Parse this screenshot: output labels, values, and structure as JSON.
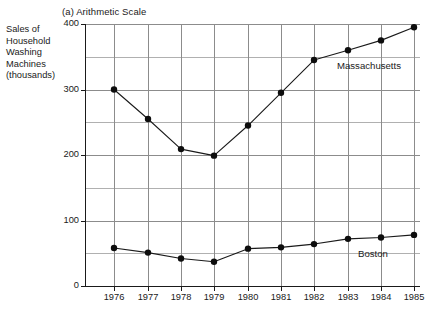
{
  "figure": {
    "title": "(a) Arithmetic Scale",
    "y_axis_block_label": [
      "Sales of",
      "Household",
      "Washing",
      "Machines",
      "(thousands)"
    ]
  },
  "chart_data": {
    "type": "line",
    "title": "(a) Arithmetic Scale",
    "xlabel": "",
    "ylabel": "Sales of Household Washing Machines (thousands)",
    "x": [
      "1976",
      "1977",
      "1978",
      "1979",
      "1980",
      "1981",
      "1982",
      "1983",
      "1984",
      "1985"
    ],
    "categories": [
      "1976",
      "1977",
      "1978",
      "1979",
      "1980",
      "1981",
      "1982",
      "1983",
      "1984",
      "1985"
    ],
    "series": [
      {
        "name": "Massachusetts",
        "values": [
          300,
          255,
          209,
          199,
          245,
          295,
          345,
          360,
          375,
          395
        ],
        "label_text": "Massachusetts"
      },
      {
        "name": "Boston",
        "values": [
          58,
          51,
          42,
          37,
          57,
          59,
          64,
          72,
          74,
          78
        ],
        "label_text": "Boston"
      }
    ],
    "ylim": [
      0,
      400
    ],
    "y_ticks": [
      0,
      100,
      200,
      300,
      400
    ],
    "y_tick_labels": [
      "0",
      "100",
      "200",
      "300",
      "400"
    ],
    "y_minor_ticks": [
      50,
      150,
      250,
      350
    ],
    "x_tick_labels": [
      "1976",
      "1977",
      "1978",
      "1979",
      "1980",
      "1981",
      "1982",
      "1983",
      "1984",
      "1985"
    ],
    "grid": true,
    "legend": "inline-annotations",
    "marker": "filled-circle",
    "line_color": "#1a1a1a",
    "grid_color": "#8c8c8c",
    "background": "#ffffff"
  }
}
